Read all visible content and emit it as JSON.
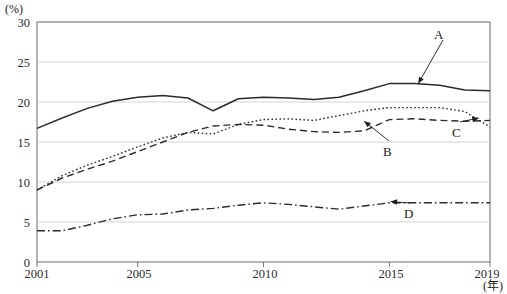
{
  "chart_data": {
    "type": "line",
    "title": "",
    "xlabel": "(年)",
    "ylabel": "(%)",
    "unit_top_left": "(%)",
    "unit_bottom_right": "(年)",
    "x": [
      2001,
      2002,
      2003,
      2004,
      2005,
      2006,
      2007,
      2008,
      2009,
      2010,
      2011,
      2012,
      2013,
      2014,
      2015,
      2016,
      2017,
      2018,
      2019
    ],
    "xlim": [
      2001,
      2019
    ],
    "ylim": [
      0,
      30
    ],
    "yticks": [
      0,
      5,
      10,
      15,
      20,
      25,
      30
    ],
    "xticks": [
      2001,
      2005,
      2010,
      2015,
      2019
    ],
    "xtick_labels": [
      "2001",
      "2005",
      "2010",
      "2015",
      "2019"
    ],
    "ytick_labels": [
      "0",
      "5",
      "10",
      "15",
      "20",
      "25",
      "30"
    ],
    "grid": true,
    "grid_axis": "y",
    "legend": "inline-annotations",
    "series": [
      {
        "name": "A",
        "style": "solid",
        "label": "A",
        "values": [
          16.7,
          18.0,
          19.2,
          20.1,
          20.6,
          20.8,
          20.5,
          18.9,
          20.4,
          20.6,
          20.5,
          20.3,
          20.6,
          21.4,
          22.3,
          22.3,
          22.1,
          21.5,
          21.4
        ]
      },
      {
        "name": "B",
        "style": "dashed",
        "label": "B",
        "values": [
          9.0,
          10.5,
          11.6,
          12.6,
          13.8,
          15.0,
          16.2,
          17.0,
          17.2,
          17.1,
          16.6,
          16.3,
          16.2,
          16.4,
          17.8,
          17.9,
          17.7,
          17.6,
          17.7
        ]
      },
      {
        "name": "C",
        "style": "dotted",
        "label": "C",
        "values": [
          9.0,
          10.8,
          12.1,
          13.2,
          14.4,
          15.5,
          16.2,
          16.0,
          17.2,
          17.8,
          17.9,
          17.7,
          18.3,
          18.9,
          19.3,
          19.3,
          19.3,
          18.8,
          16.9
        ]
      },
      {
        "name": "D",
        "style": "dash-dot",
        "label": "D",
        "values": [
          3.9,
          3.9,
          4.6,
          5.4,
          5.9,
          6.0,
          6.5,
          6.7,
          7.1,
          7.4,
          7.2,
          6.9,
          6.6,
          7.0,
          7.4,
          7.4,
          7.4,
          7.4,
          7.4
        ]
      }
    ],
    "annotations": [
      {
        "label": "A",
        "points_to_series": "A",
        "x": 2016.2,
        "y": 22.6
      },
      {
        "label": "B",
        "points_to_series": "B",
        "x": 2014.3,
        "y": 14.6
      },
      {
        "label": "C",
        "points_to_series": "C",
        "x": 2017.9,
        "y": 13.2
      },
      {
        "label": "D",
        "points_to_series": "D",
        "x": 2015.9,
        "y": 7.0
      }
    ],
    "colors": {
      "line": "#2b2b2b",
      "grid": "#c8c8c8",
      "axis": "#555555",
      "background": "#ffffff",
      "text": "#1a1a1a"
    }
  },
  "axis": {
    "y_unit": "(%)",
    "x_unit": "(年)",
    "y_labels": [
      "30",
      "25",
      "20",
      "15",
      "10",
      "5",
      "0"
    ],
    "x_labels": [
      "2001",
      "2005",
      "2010",
      "2015",
      "2019"
    ]
  },
  "series_labels": {
    "a": "A",
    "b": "B",
    "c": "C",
    "d": "D"
  }
}
